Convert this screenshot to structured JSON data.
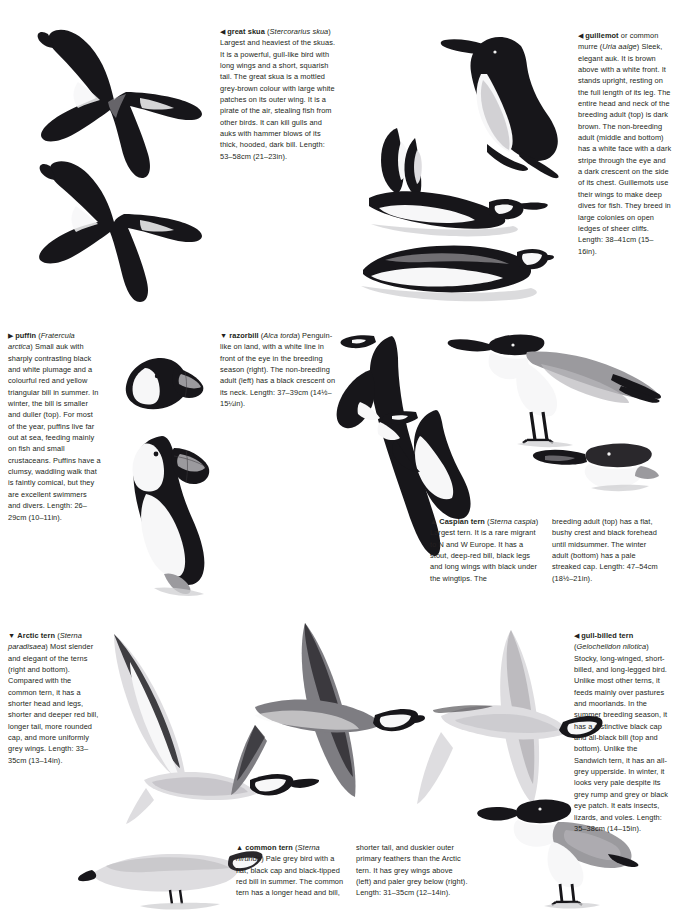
{
  "page": {
    "type": "field-guide-spread",
    "background": "#ffffff"
  },
  "entries": [
    {
      "id": "great-skua",
      "marker": "◀",
      "name": "great skua",
      "scientific": "Stercorarius skua",
      "body": "Largest and heaviest of the skuas. It is a powerful, gull-like bird with long wings and a short, squarish tail. The great skua is a mottled grey-brown colour with large white patches on its outer wing. It is a pirate of the air, stealing fish from other birds. It can kill gulls and auks with hammer blows of its thick, hooded, dark bill.",
      "length": "Length: 53–58cm (21–23in)."
    },
    {
      "id": "guillemot",
      "marker": "◀",
      "name": "guillemot",
      "name_suffix": " or common murre",
      "scientific": "Uria aalge",
      "body": "Sleek, elegant auk. It is brown above with a white front. It stands upright, resting on the full length of its leg. The entire head and neck of the breeding adult (top) is dark brown. The non-breeding adult (middle and bottom) has a white face with a dark stripe through the eye and a dark crescent on the side of its chest. Guillemots use their wings to make deep dives for fish. They breed in large colonies on open ledges of sheer cliffs.",
      "length": "Length: 38–41cm (15–16in)."
    },
    {
      "id": "puffin",
      "marker": "▶",
      "name": "puffin",
      "scientific": "Fratercula arctica",
      "body": "Small auk with sharply contrasting black and white plumage and a colourful red and yellow triangular bill in summer. In winter, the bill is smaller and duller (top). For most of the year, puffins live far out at sea, feeding mainly on fish and small crustaceans. Puffins have a clumsy, waddling walk that is faintly comical, but they are excellent swimmers and divers.",
      "length": "Length: 26–29cm (10–11in)."
    },
    {
      "id": "razorbill",
      "marker": "▼",
      "name": "razorbill",
      "scientific": "Alca torda",
      "body": "Penguin-like on land, with a white line in front of the eye in the breeding season (right). The non-breeding adult (left) has a black crescent on its neck.",
      "length": "Length: 37–39cm (14½–15¼in)."
    },
    {
      "id": "caspian-tern",
      "marker": "▲",
      "name": "Caspian tern",
      "scientific": "Sterna caspia",
      "body": "Largest tern. It is a rare migrant to N and W Europe. It has a stout, deep-red bill, black legs and long wings with black under the wingtips. The",
      "body_cont": "breeding adult (top) has a flat, bushy crest and black forehead until midsummer. The winter adult (bottom) has a pale streaked cap.",
      "length": "Length: 47–54cm (18½–21in)."
    },
    {
      "id": "arctic-tern",
      "marker": "▼",
      "name": "Arctic tern",
      "scientific": "Sterna paradisaea",
      "body": "Most slender and elegant of the terns (right and bottom). Compared with the common tern, it has a shorter head and legs, shorter and deeper red bill, longer tail, more rounded cap, and more uniformly grey wings.",
      "length": "Length: 33–35cm (13–14in)."
    },
    {
      "id": "gull-billed-tern",
      "marker": "◀",
      "name": "gull-billed tern",
      "scientific": "Gelochelidon nilotica",
      "body": "Stocky, long-winged, short-billed, and long-legged bird. Unlike most other terns, it feeds mainly over pastures and moorlands. In the summer breeding season, it has a distinctive black cap and all-black bill (top and bottom). Unlike the Sandwich tern, it has an all-grey upperside. In winter, it looks very pale despite its grey rump and grey or black eye patch. It eats insects, lizards, and voles.",
      "length": "Length: 35–38cm (14–15in)."
    },
    {
      "id": "common-tern",
      "marker": "▲",
      "name": "common tern",
      "scientific": "Sterna hirundo",
      "body": "Pale grey bird with a flat, black cap and black-tipped red bill in summer. The common tern has a longer head and bill,",
      "body_cont": "shorter tail, and duskier outer primary feathers than the Arctic tern. It has grey wings above (left) and paler grey below (right).",
      "length": "Length: 31–35cm (12–14in)."
    }
  ],
  "illustrations": [
    {
      "id": "great-skua-flying-upper",
      "subject": "great skua in flight from above"
    },
    {
      "id": "great-skua-flying-lower",
      "subject": "great skua in flight from below"
    },
    {
      "id": "guillemot-standing",
      "subject": "guillemot breeding adult standing"
    },
    {
      "id": "guillemot-swimming-wings",
      "subject": "guillemot non-breeding adult with raised wings"
    },
    {
      "id": "guillemot-swimming",
      "subject": "guillemot non-breeding adult swimming"
    },
    {
      "id": "puffin-winter-head",
      "subject": "puffin winter head"
    },
    {
      "id": "puffin-summer-standing",
      "subject": "puffin summer adult standing"
    },
    {
      "id": "razorbill-nonbreeding",
      "subject": "razorbill non-breeding adult"
    },
    {
      "id": "razorbill-breeding",
      "subject": "razorbill breeding adult"
    },
    {
      "id": "caspian-tern-standing",
      "subject": "Caspian tern breeding adult standing"
    },
    {
      "id": "caspian-tern-winter-head",
      "subject": "Caspian tern winter adult head"
    },
    {
      "id": "arctic-tern-flying",
      "subject": "Arctic tern in flight"
    },
    {
      "id": "arctic-tern-perched",
      "subject": "Arctic tern perched"
    },
    {
      "id": "common-tern-flying-above",
      "subject": "common tern in flight from above"
    },
    {
      "id": "common-tern-flying-below",
      "subject": "common tern in flight from below"
    },
    {
      "id": "gull-billed-tern-standing",
      "subject": "gull-billed tern standing"
    }
  ]
}
